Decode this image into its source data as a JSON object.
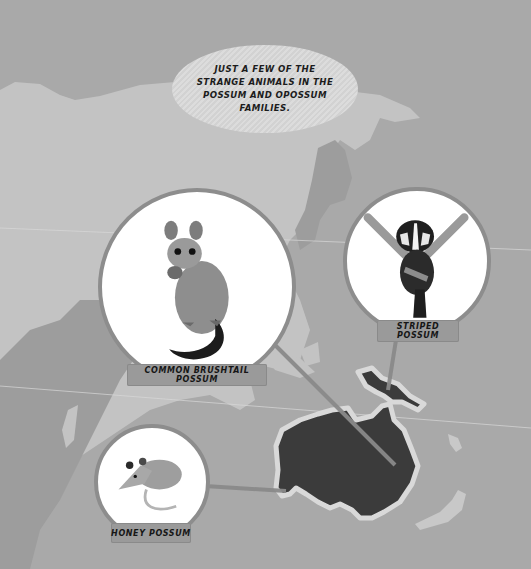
{
  "caption": {
    "text": "JUST A FEW OF THE STRANGE ANIMALS IN THE POSSUM AND OPOSSUM FAMILIES."
  },
  "animals": [
    {
      "label": "COMMON BRUSHTAIL POSSUM",
      "icon": "brushtail-possum-illustration"
    },
    {
      "label": "STRIPED POSSUM",
      "icon": "striped-possum-illustration"
    },
    {
      "label": "HONEY POSSUM",
      "icon": "honey-possum-illustration"
    }
  ],
  "map": {
    "highlighted_region": "Australia and New Guinea",
    "colors": {
      "sea": "#a9a9a9",
      "land": "#c3c3c3",
      "land_shadow": "#9d9d9d",
      "highlight": "#3b3b3b",
      "highlight_outline": "#d9d9d9",
      "connector": "#8a8a8a"
    }
  }
}
